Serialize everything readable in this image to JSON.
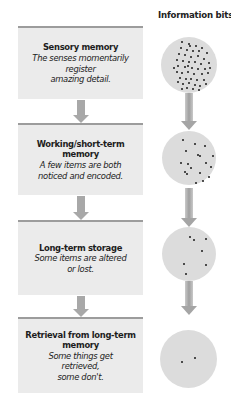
{
  "header": {
    "label": "Information bits"
  },
  "stages": [
    {
      "title": "Sensory memory",
      "description": "The senses momentarily\nregister\namazing detail."
    },
    {
      "title": "Working/short-term\nmemory",
      "description": "A few items are both\nnoticed and encoded."
    },
    {
      "title": "Long-term storage",
      "description": "Some items are altered\nor lost."
    },
    {
      "title": "Retrieval from long-term\nmemory",
      "description": "Some things get\nretrieved,\nsome don't."
    }
  ],
  "information_bits": [
    {
      "stage": "Sensory memory",
      "dot_count": 50
    },
    {
      "stage": "Working/short-term memory",
      "dot_count": 18
    },
    {
      "stage": "Long-term storage",
      "dot_count": 7
    },
    {
      "stage": "Retrieval from long-term memory",
      "dot_count": 2
    }
  ],
  "colors": {
    "box_fill": "#ebebeb",
    "box_border": "#9c9c9c",
    "arrow": "#a8a8a8",
    "circle_fill": "#dcdcdc",
    "dot": "#1b1b1b"
  }
}
